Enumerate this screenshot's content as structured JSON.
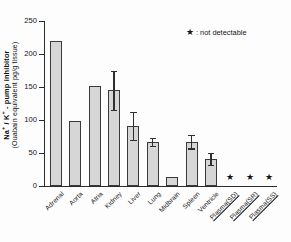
{
  "chart_data": {
    "type": "bar",
    "title": "",
    "xlabel": "",
    "ylabel": "Na+ / K+ - pump inhibitor (Ouabain equivalent pg/g tissue)",
    "ylabel_line1": "Na+ / K+ - pump inhibitor",
    "ylabel_line2": "(Ouabain equivalent pg/g tissue)",
    "ylim": [
      0,
      250
    ],
    "yticks": [
      0,
      50,
      100,
      150,
      200,
      250
    ],
    "grid": false,
    "legend_position": "top-right",
    "categories": [
      "Adrenal",
      "Aorta",
      "Atria",
      "Kidney",
      "Liver",
      "Lung",
      "Midbrain",
      "Spleen",
      "Ventricle",
      "Plasma(SD)",
      "Plasma(SR)",
      "Plasma(SS)"
    ],
    "values": [
      220,
      99,
      151,
      145,
      91,
      67,
      14,
      67,
      41,
      null,
      null,
      null
    ],
    "errors": [
      null,
      null,
      null,
      30,
      21,
      6,
      null,
      10,
      9,
      null,
      null,
      null
    ],
    "not_detectable": [
      false,
      false,
      false,
      false,
      false,
      false,
      false,
      false,
      false,
      true,
      true,
      true
    ],
    "not_detectable_marker": "★",
    "underlined_labels": [
      "Plasma(SD)",
      "Plasma(SR)",
      "Plasma(SS)"
    ]
  },
  "legend": {
    "marker": "★",
    "separator": ":",
    "label": "not detectable"
  }
}
